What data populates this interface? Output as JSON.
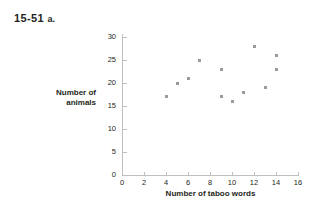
{
  "figure": {
    "problem_number": "15-51",
    "problem_part": "a."
  },
  "chart_data": {
    "type": "scatter",
    "title": "",
    "xlabel": "Number of taboo words",
    "ylabel": "Number of animals",
    "ylabel_lines": [
      "Number of",
      "animals"
    ],
    "xlim": [
      0,
      16
    ],
    "ylim": [
      0,
      31
    ],
    "xticks": [
      0,
      2,
      4,
      6,
      8,
      10,
      12,
      14,
      16
    ],
    "yticks": [
      0,
      5,
      10,
      15,
      20,
      25,
      30
    ],
    "xtick_labels": [
      "0",
      "2",
      "4",
      "6",
      "8",
      "10",
      "12",
      "14",
      "16"
    ],
    "ytick_labels": [
      "0",
      "5",
      "10",
      "15",
      "20",
      "25",
      "30"
    ],
    "grid": false,
    "legend": false,
    "marker": "square",
    "marker_color": "#9b9b9f",
    "axis_color": "#bfbfbf",
    "points": [
      {
        "x": 4,
        "y": 17
      },
      {
        "x": 5,
        "y": 20
      },
      {
        "x": 6,
        "y": 21
      },
      {
        "x": 7,
        "y": 25
      },
      {
        "x": 9,
        "y": 17
      },
      {
        "x": 9,
        "y": 23
      },
      {
        "x": 10,
        "y": 16
      },
      {
        "x": 11,
        "y": 18
      },
      {
        "x": 12,
        "y": 28
      },
      {
        "x": 13,
        "y": 19
      },
      {
        "x": 14,
        "y": 26
      },
      {
        "x": 14,
        "y": 23
      }
    ]
  }
}
